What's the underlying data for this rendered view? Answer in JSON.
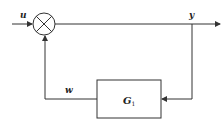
{
  "diagram": {
    "type": "feedback-block-diagram",
    "signals": {
      "input": "u",
      "output": "y",
      "feedback": "w"
    },
    "blocks": [
      {
        "id": "G1",
        "label": "G",
        "subscript": "1"
      }
    ],
    "summing_junction": {
      "symbol": "cross-circle"
    },
    "colors": {
      "line": "#333333",
      "background": "#ffffff"
    }
  }
}
